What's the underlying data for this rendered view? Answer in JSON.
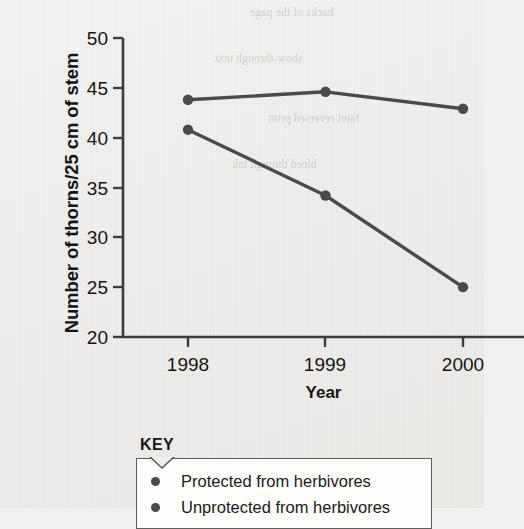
{
  "chart_data": {
    "type": "line",
    "title": "",
    "xlabel": "Year",
    "ylabel": "Number of thorns/25 cm of stem",
    "categories": [
      "1998",
      "1999",
      "2000"
    ],
    "x": [
      1998,
      1999,
      2000
    ],
    "xlim": [
      1997.5,
      2000.5
    ],
    "ylim": [
      20,
      50
    ],
    "yticks": [
      "20",
      "25",
      "30",
      "35",
      "40",
      "45",
      "50"
    ],
    "ytick_values": [
      20,
      25,
      30,
      35,
      40,
      45,
      50
    ],
    "ytick_step": 5,
    "grid": false,
    "legend_position": "below-plot-left",
    "marker": "circle",
    "line_color": "#4a4a4a",
    "axis_color": "#3c3c3c",
    "background_color": "#f1f0ee",
    "series": [
      {
        "name": "Protected from herbivores",
        "values": [
          43.8,
          44.6,
          42.9
        ]
      },
      {
        "name": "Unprotected from herbivores",
        "values": [
          40.8,
          34.2,
          25.0
        ]
      }
    ]
  },
  "axes": {
    "y_title": "Number of thorns/25 cm of stem",
    "x_title": "Year",
    "y_ticks": [
      "50",
      "45",
      "40",
      "35",
      "30",
      "25",
      "20"
    ],
    "x_ticks": [
      "1998",
      "1999",
      "2000"
    ]
  },
  "key": {
    "title": "KEY",
    "entries": [
      {
        "marker": "filled-circle",
        "label": "Protected from herbivores"
      },
      {
        "marker": "filled-circle",
        "label": "Unprotected from herbivores"
      }
    ]
  },
  "background_text": {
    "line1": "backs of the page",
    "line2": "show-through text",
    "line3": "faint reversed print",
    "line4": "bleed through ink"
  }
}
